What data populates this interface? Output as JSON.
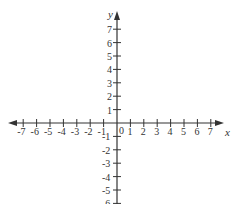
{
  "chart_data": {
    "type": "coordinate_plane",
    "title": "",
    "xlabel": "x",
    "ylabel": "y",
    "origin_label": "0",
    "x_ticks": [
      "-7",
      "-6",
      "-5",
      "-4",
      "-3",
      "-2",
      "-1",
      "1",
      "2",
      "3",
      "4",
      "5",
      "6",
      "7"
    ],
    "y_ticks": [
      "7",
      "6",
      "5",
      "4",
      "3",
      "2",
      "1",
      "-1",
      "-2",
      "-3",
      "-4",
      "-5",
      "-6"
    ],
    "xlim": [
      -7,
      7
    ],
    "ylim": [
      -6,
      7
    ],
    "grid": false
  },
  "style": {
    "axis_color": "#333333",
    "background": "#ffffff"
  }
}
